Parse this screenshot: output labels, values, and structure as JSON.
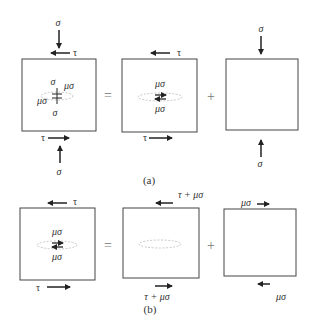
{
  "figure": {
    "panel_a": {
      "caption": "(a)",
      "operator_equals": "=",
      "operator_plus": "+",
      "box1": {
        "top_normal_label": "σ",
        "top_shear_label": "τ",
        "bottom_shear_label": "τ",
        "bottom_normal_label": "σ",
        "inner_top": "σ",
        "inner_right": "μσ",
        "inner_left": "μσ",
        "inner_bottom": "σ"
      },
      "box2": {
        "top_shear_label": "τ",
        "bottom_shear_label": "τ",
        "inner_top": "μσ",
        "inner_bottom": "μσ"
      },
      "box3": {
        "top_normal_label": "σ",
        "bottom_normal_label": "σ"
      }
    },
    "panel_b": {
      "caption": "(b)",
      "operator_equals": "=",
      "operator_plus": "+",
      "box1": {
        "top_shear_label": "τ",
        "bottom_shear_label": "τ",
        "inner_top": "μσ",
        "inner_bottom": "μσ"
      },
      "box2": {
        "top_shear_label": "τ + μσ",
        "bottom_shear_label": "τ + μσ"
      },
      "box3": {
        "top_shear_label": "μσ",
        "bottom_shear_label": "μσ"
      }
    }
  }
}
